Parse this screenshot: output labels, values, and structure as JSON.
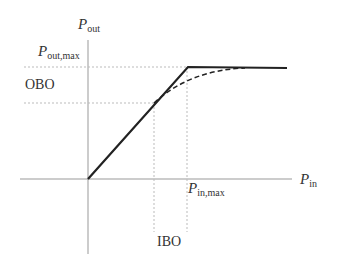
{
  "diagram": {
    "y_axis": {
      "symbol": "P",
      "subscript": "out"
    },
    "x_axis": {
      "symbol": "P",
      "subscript": "in"
    },
    "labels": {
      "pout_max": {
        "symbol": "P",
        "subscript": "out,max"
      },
      "pin_max": {
        "symbol": "P",
        "subscript": "in,max"
      },
      "obo": "OBO",
      "ibo": "IBO"
    },
    "curves": [
      {
        "name": "ideal-limiter",
        "style": "solid",
        "description": "linear up to saturation knee, then flat at Pout,max"
      },
      {
        "name": "real-amplifier",
        "style": "dashed",
        "description": "compresses smoothly toward Pout,max"
      }
    ],
    "colors": {
      "curve": "#222222",
      "axis": "#999999",
      "guide": "#bbbbbb",
      "text": "#333333"
    }
  }
}
